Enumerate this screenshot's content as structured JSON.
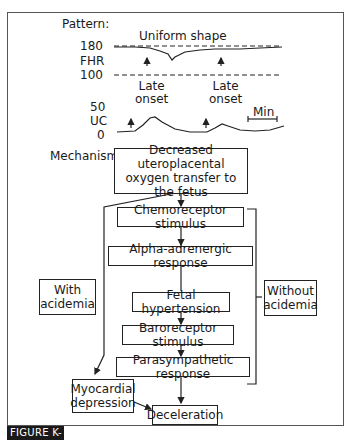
{
  "figure": {
    "caption": "FIGURE K-3",
    "pattern_label": "Pattern:",
    "mechanism_label": "Mechanism:",
    "tracing": {
      "title": "Uniform shape",
      "fhr": {
        "label": "FHR",
        "upper": "180",
        "lower": "100"
      },
      "uc": {
        "label": "UC",
        "upper": "50",
        "lower": "0"
      },
      "onset_labels": [
        {
          "line1": "Late",
          "line2": "onset"
        },
        {
          "line1": "Late",
          "line2": "onset"
        }
      ],
      "scale_label": "Min"
    },
    "flow": {
      "root": [
        "Decreased uteroplacental",
        "oxygen transfer to",
        "the fetus"
      ],
      "steps": [
        "Chemoreceptor stimulus",
        "Alpha-adrenergic response",
        "Fetal hypertension",
        "Baroreceptor stimulus",
        "Parasympathetic response"
      ],
      "with_acidemia": [
        "With",
        "acidemia"
      ],
      "without_acidemia": [
        "Without",
        "acidemia"
      ],
      "myocardial": [
        "Myocardial",
        "depression"
      ],
      "outcome": "Deceleration"
    }
  }
}
